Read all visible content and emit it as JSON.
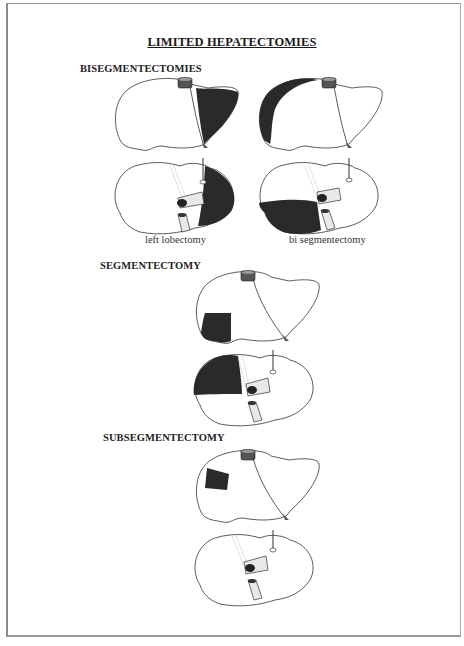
{
  "title": "LIMITED HEPATECTOMIES",
  "sections": [
    {
      "heading": "BISEGMENTECTOMIES",
      "figures": [
        {
          "caption": "left lobectomy",
          "shaded_region": "left lobe"
        },
        {
          "caption": "bi segmentectomy",
          "shaded_region": "right posterior segments"
        }
      ]
    },
    {
      "heading": "SEGMENTECTOMY",
      "figures": [
        {
          "caption": "",
          "shaded_region": "single right segment"
        }
      ]
    },
    {
      "heading": "SUBSEGMENTECTOMY",
      "figures": [
        {
          "caption": "",
          "shaded_region": "subsegment of right lobe"
        }
      ]
    }
  ],
  "colors": {
    "resected": "#2a2a2a",
    "outline": "#333333",
    "liver_fill": "#ffffff",
    "page_border": "#8a8a8a"
  }
}
